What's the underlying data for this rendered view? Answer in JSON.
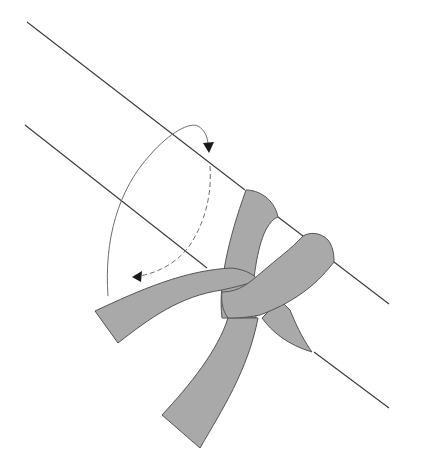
{
  "diagram": {
    "colors": {
      "background": "#ffffff",
      "pole_line": "#3a3a3a",
      "rope_fill": "#a9a9a9",
      "rope_outline": "#555555",
      "arrow": "#6e6e6e",
      "arrowhead": "#1a1a1a"
    },
    "elements": {
      "pole": "pole-outline",
      "rope": "rope-band",
      "rotation_arrow": "wrap-direction-arrow"
    }
  }
}
